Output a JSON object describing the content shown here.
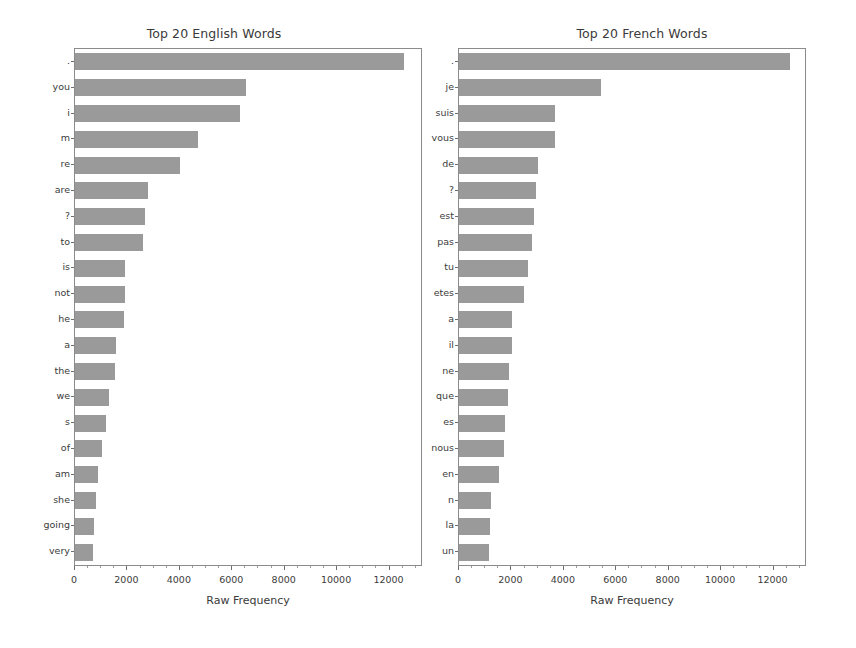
{
  "figure": {
    "background_color": "#ffffff",
    "bar_color": "#9a9a9a",
    "axis_color": "#8b8b8b",
    "text_color": "#3c3c3c",
    "width": 856,
    "height": 648
  },
  "chart_data": [
    {
      "type": "bar",
      "orientation": "horizontal",
      "title": "Top 20 English Words",
      "xlabel": "Raw Frequency",
      "ylabel": "",
      "grid": false,
      "legend": "none",
      "xlim": [
        0,
        13200
      ],
      "xticks": [
        0,
        2000,
        4000,
        6000,
        8000,
        10000,
        12000
      ],
      "xticklabels": [
        "0",
        "2000",
        "4000",
        "6000",
        "8000",
        "10000",
        "12000"
      ],
      "categories": [
        ".",
        "you",
        "i",
        "m",
        "re",
        "are",
        "?",
        "to",
        "is",
        "not",
        "he",
        "a",
        "the",
        "we",
        "s",
        "of",
        "am",
        "she",
        "going",
        "very"
      ],
      "values": [
        12550,
        6540,
        6290,
        4680,
        4000,
        2790,
        2670,
        2580,
        1910,
        1890,
        1860,
        1570,
        1530,
        1280,
        1200,
        1040,
        880,
        790,
        730,
        690
      ]
    },
    {
      "type": "bar",
      "orientation": "horizontal",
      "title": "Top 20 French Words",
      "xlabel": "Raw Frequency",
      "ylabel": "",
      "grid": false,
      "legend": "none",
      "xlim": [
        0,
        13200
      ],
      "xticks": [
        0,
        2000,
        4000,
        6000,
        8000,
        10000,
        12000
      ],
      "xticklabels": [
        "0",
        "2000",
        "4000",
        "6000",
        "8000",
        "10000",
        "12000"
      ],
      "categories": [
        ".",
        "je",
        "suis",
        "vous",
        "de",
        "?",
        "est",
        "pas",
        "tu",
        "etes",
        "a",
        "il",
        "ne",
        "que",
        "es",
        "nous",
        "en",
        "n",
        "la",
        "un"
      ],
      "values": [
        12640,
        5435,
        3650,
        3650,
        3020,
        2920,
        2870,
        2790,
        2615,
        2490,
        2040,
        2010,
        1890,
        1860,
        1760,
        1700,
        1510,
        1230,
        1195,
        1155
      ]
    }
  ]
}
